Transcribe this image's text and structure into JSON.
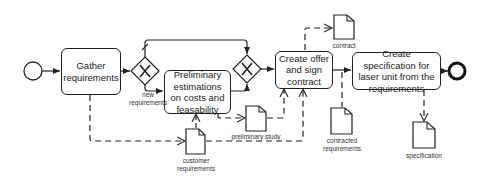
{
  "diagram": {
    "type": "BPMN process",
    "events": {
      "start": {
        "label": ""
      },
      "end": {
        "label": ""
      }
    },
    "tasks": {
      "gather": {
        "label": "Gather requirements"
      },
      "preliminary": {
        "label": "Preliminary estimations on costs and feasability"
      },
      "offer": {
        "label": "Create offer and sign contract"
      },
      "specification": {
        "label": "Create specification for laser unit from the requirements"
      }
    },
    "gateways": {
      "split": {
        "type": "exclusive",
        "symbol": "X"
      },
      "merge": {
        "type": "exclusive",
        "symbol": "X"
      }
    },
    "flow_labels": {
      "new_requirements_1": "new",
      "new_requirements_2": "requirements"
    },
    "data_objects": {
      "customer_requirements": {
        "line1": "customer",
        "line2": "requirements"
      },
      "preliminary_study": {
        "line1": "preliminary study"
      },
      "contract": {
        "line1": "contract"
      },
      "contracted_requirements": {
        "line1": "contracted",
        "line2": "requirements"
      },
      "specification": {
        "line1": "specification"
      }
    },
    "colors": {
      "stroke": "#222222",
      "background": "#ffffff"
    }
  }
}
